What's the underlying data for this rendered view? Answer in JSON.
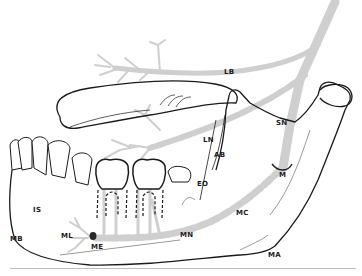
{
  "diagram": {
    "colors": {
      "bone_outline": "#1a1a1a",
      "nerve": "#cfcfcf",
      "background": "#ffffff",
      "baseline": "#bdbdbd"
    },
    "labels": [
      {
        "id": "LB",
        "text": "LB",
        "x": 224,
        "y": 69
      },
      {
        "id": "SN",
        "text": "SN",
        "x": 276,
        "y": 120
      },
      {
        "id": "LN",
        "text": "LN",
        "x": 203,
        "y": 137
      },
      {
        "id": "AB",
        "text": "AB",
        "x": 214,
        "y": 152
      },
      {
        "id": "EO",
        "text": "EO",
        "x": 197,
        "y": 181
      },
      {
        "id": "M",
        "text": "M",
        "x": 279,
        "y": 172
      },
      {
        "id": "MC",
        "text": "MC",
        "x": 236,
        "y": 210
      },
      {
        "id": "MN",
        "text": "MN",
        "x": 180,
        "y": 232
      },
      {
        "id": "MA",
        "text": "MA",
        "x": 268,
        "y": 252
      },
      {
        "id": "IS",
        "text": "IS",
        "x": 33,
        "y": 207
      },
      {
        "id": "MB",
        "text": "MB",
        "x": 10,
        "y": 236
      },
      {
        "id": "ML",
        "text": "ML",
        "x": 61,
        "y": 233
      },
      {
        "id": "ME",
        "text": "ME",
        "x": 91,
        "y": 244
      }
    ]
  }
}
